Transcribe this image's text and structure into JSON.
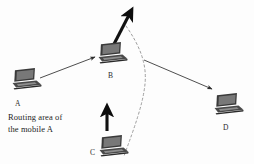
{
  "figure": {
    "background_color": "#fdfdfd",
    "line_color": "#3a3a3a",
    "bold_arrow_color": "#111111",
    "dashed_color": "#9a9a9a",
    "laptop_color": "#2e2e2e"
  },
  "caption": {
    "line1": "Routing area of",
    "line2": "the mobile A"
  },
  "nodes": [
    {
      "id": "A",
      "label": "A",
      "icon": "laptop-icon",
      "x": 10,
      "y": 66,
      "label_x": 15,
      "label_y": 100
    },
    {
      "id": "B",
      "label": "B",
      "icon": "laptop-icon",
      "x": 96,
      "y": 40,
      "label_x": 108,
      "label_y": 72
    },
    {
      "id": "C",
      "label": "C",
      "icon": "laptop-icon",
      "x": 97,
      "y": 133,
      "label_x": 90,
      "label_y": 149
    },
    {
      "id": "D",
      "label": "D",
      "icon": "laptop-icon",
      "x": 212,
      "y": 91,
      "label_x": 223,
      "label_y": 124
    }
  ],
  "links": [
    {
      "name": "route-a-to-b",
      "from": "A",
      "to": "B",
      "style": "thin-arrow"
    },
    {
      "name": "route-boundary-to-d",
      "from": "routing-area-boundary",
      "to": "D",
      "style": "thin-arrow"
    }
  ],
  "motion_arrows": [
    {
      "name": "mobility-arrow-b",
      "at": "B",
      "direction": "up-right",
      "style": "bold-arrow"
    },
    {
      "name": "mobility-arrow-c",
      "at": "C",
      "direction": "up",
      "style": "bold-arrow"
    }
  ],
  "routing_area": {
    "name": "routing-area-boundary",
    "style": "dashed-curve",
    "description": "Dashed arc marking the edge of the routing area of the mobile A"
  }
}
